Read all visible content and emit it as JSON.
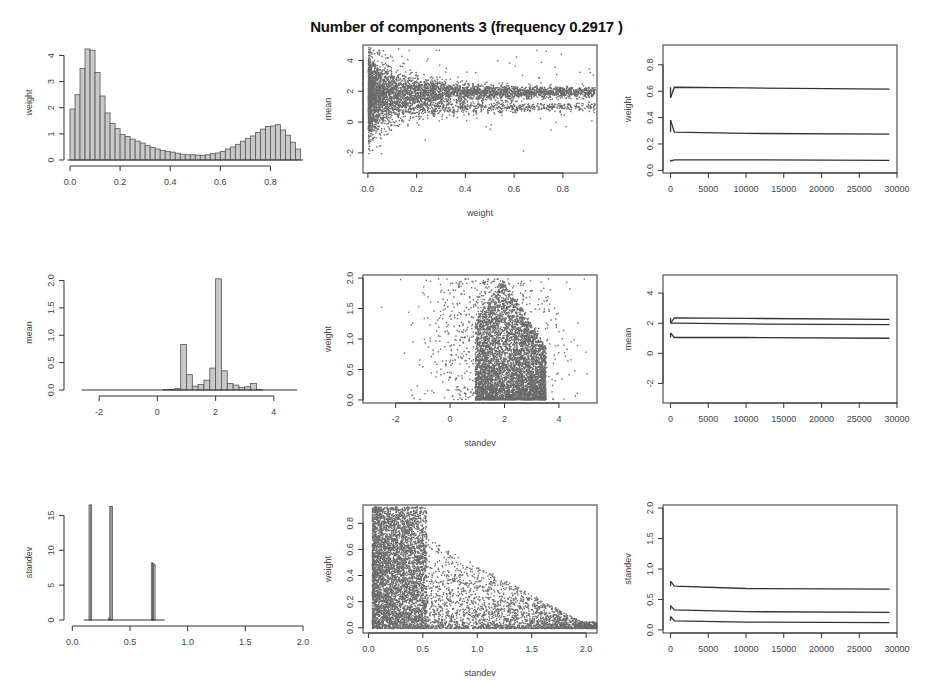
{
  "title": "Number of components 3 (frequency 0.2917 )",
  "colors": {
    "bar_fill": "#c8c8c8",
    "bar_stroke": "#555555",
    "points": "#6b6b6b",
    "lines": "#333333",
    "axes": "#333333"
  },
  "chart_data": [
    {
      "id": "hist-weight",
      "type": "bar",
      "title": "",
      "xlabel": "",
      "ylabel": "weight",
      "xlim": [
        0,
        0.93
      ],
      "ylim": [
        0,
        4.4
      ],
      "xticks": [
        "0.0",
        "0.2",
        "0.4",
        "0.6",
        "0.8"
      ],
      "yticks": [
        "0",
        "1",
        "2",
        "3",
        "4"
      ],
      "bin_width": 0.02,
      "categories": [
        0.01,
        0.03,
        0.05,
        0.07,
        0.09,
        0.11,
        0.13,
        0.15,
        0.17,
        0.19,
        0.21,
        0.23,
        0.25,
        0.27,
        0.29,
        0.31,
        0.33,
        0.35,
        0.37,
        0.39,
        0.41,
        0.43,
        0.45,
        0.47,
        0.49,
        0.51,
        0.53,
        0.55,
        0.57,
        0.59,
        0.61,
        0.63,
        0.65,
        0.67,
        0.69,
        0.71,
        0.73,
        0.75,
        0.77,
        0.79,
        0.81,
        0.83,
        0.85,
        0.87,
        0.89,
        0.91
      ],
      "values": [
        1.95,
        2.5,
        3.5,
        4.25,
        4.2,
        3.35,
        2.45,
        1.8,
        1.4,
        1.2,
        0.98,
        0.9,
        0.8,
        0.72,
        0.65,
        0.55,
        0.48,
        0.42,
        0.36,
        0.33,
        0.3,
        0.26,
        0.22,
        0.2,
        0.2,
        0.19,
        0.18,
        0.2,
        0.24,
        0.27,
        0.33,
        0.42,
        0.5,
        0.6,
        0.72,
        0.83,
        0.92,
        1.05,
        1.18,
        1.28,
        1.3,
        1.35,
        1.15,
        0.95,
        0.68,
        0.42
      ]
    },
    {
      "id": "scatter-weight-mean",
      "type": "scatter",
      "title": "",
      "xlabel": "weight",
      "ylabel": "mean",
      "xlim": [
        -0.02,
        0.94
      ],
      "ylim": [
        -3.3,
        5.0
      ],
      "xticks": [
        "0.0",
        "0.2",
        "0.4",
        "0.6",
        "0.8"
      ],
      "yticks": [
        "-2",
        "0",
        "2",
        "4"
      ],
      "description": "Dense cloud near weight 0 spanning mean -2 to 4, funnelling to bands at mean ~2 and ~1 as weight increases"
    },
    {
      "id": "trace-weight",
      "type": "line",
      "title": "",
      "xlabel": "",
      "ylabel": "weight",
      "xlim": [
        -1000,
        30000
      ],
      "ylim": [
        -0.02,
        0.95
      ],
      "xticks": [
        "0",
        "5000",
        "10000",
        "15000",
        "20000",
        "25000",
        "30000"
      ],
      "yticks": [
        "0.0",
        "0.2",
        "0.4",
        "0.6",
        "0.8"
      ],
      "series": [
        {
          "name": "component 1",
          "x": [
            0,
            500,
            10000,
            29000
          ],
          "values": [
            0.55,
            0.63,
            0.625,
            0.615
          ]
        },
        {
          "name": "component 2",
          "x": [
            0,
            500,
            10000,
            29000
          ],
          "values": [
            0.38,
            0.29,
            0.28,
            0.275
          ]
        },
        {
          "name": "component 3",
          "x": [
            0,
            500,
            10000,
            29000
          ],
          "values": [
            0.07,
            0.08,
            0.08,
            0.075
          ]
        }
      ]
    },
    {
      "id": "hist-mean",
      "type": "bar",
      "title": "",
      "xlabel": "",
      "ylabel": "mean",
      "xlim": [
        -3,
        5
      ],
      "ylim": [
        0,
        2.1
      ],
      "xticks": [
        "-2",
        "0",
        "2",
        "4"
      ],
      "yticks": [
        "0.0",
        "0.5",
        "1.0",
        "1.5",
        "2.0"
      ],
      "bin_width": 0.2,
      "categories": [
        0.3,
        0.5,
        0.7,
        0.9,
        1.1,
        1.3,
        1.5,
        1.7,
        1.9,
        2.1,
        2.3,
        2.5,
        2.7,
        2.9,
        3.1,
        3.3,
        3.5
      ],
      "values": [
        0.01,
        0.01,
        0.03,
        0.83,
        0.28,
        0.07,
        0.1,
        0.18,
        0.4,
        2.03,
        0.35,
        0.12,
        0.09,
        0.05,
        0.06,
        0.12,
        0.01
      ]
    },
    {
      "id": "scatter-standev-weight",
      "type": "scatter",
      "title": "",
      "xlabel": "standev",
      "ylabel": "weight",
      "xlim": [
        -3.2,
        5.4
      ],
      "ylim": [
        -0.05,
        2.05
      ],
      "xticks": [
        "-2",
        "0",
        "2",
        "4"
      ],
      "yticks": [
        "0.0",
        "0.5",
        "1.0",
        "1.5",
        "2.0"
      ],
      "description": "Dense triangular cloud centred around x 1-3.5, concentrated at low y, sparse outliers to x -2.5 and 4.8"
    },
    {
      "id": "trace-mean",
      "type": "line",
      "title": "",
      "xlabel": "",
      "ylabel": "mean",
      "xlim": [
        -1000,
        30000
      ],
      "ylim": [
        -3.3,
        5.2
      ],
      "xticks": [
        "0",
        "5000",
        "10000",
        "15000",
        "20000",
        "25000",
        "30000"
      ],
      "yticks": [
        "-2",
        "0",
        "2",
        "4"
      ],
      "series": [
        {
          "name": "component 1",
          "x": [
            0,
            500,
            10000,
            29000
          ],
          "values": [
            2.0,
            2.35,
            2.32,
            2.25
          ]
        },
        {
          "name": "component 2",
          "x": [
            0,
            500,
            10000,
            29000
          ],
          "values": [
            2.0,
            2.0,
            1.95,
            1.9
          ]
        },
        {
          "name": "component 3",
          "x": [
            0,
            500,
            10000,
            29000
          ],
          "values": [
            1.35,
            1.05,
            1.05,
            1.0
          ]
        }
      ]
    },
    {
      "id": "hist-standev",
      "type": "bar",
      "title": "",
      "xlabel": "",
      "ylabel": "standev",
      "xlim": [
        -0.02,
        2.0
      ],
      "ylim": [
        0,
        16.5
      ],
      "xticks": [
        "0.0",
        "0.5",
        "1.0",
        "1.5",
        "2.0"
      ],
      "yticks": [
        "0",
        "5",
        "10",
        "15"
      ],
      "bin_width": 0.01,
      "categories": [
        0.15,
        0.16,
        0.32,
        0.33,
        0.34,
        0.69,
        0.7,
        0.71
      ],
      "values": [
        16.5,
        16.5,
        0.3,
        16.3,
        16.3,
        8.2,
        8.1,
        7.9
      ]
    },
    {
      "id": "scatter-standev-weight-2",
      "type": "scatter",
      "title": "",
      "xlabel": "standev",
      "ylabel": "weight",
      "xlim": [
        -0.05,
        2.1
      ],
      "ylim": [
        -0.04,
        0.94
      ],
      "xticks": [
        "0.0",
        "0.5",
        "1.0",
        "1.5",
        "2.0"
      ],
      "yticks": [
        "0.0",
        "0.2",
        "0.4",
        "0.6",
        "0.8"
      ],
      "description": "Very dense region at small standev (<0.5) spanning all weights, density decreasing with standev; sparse points toward 2.0"
    },
    {
      "id": "trace-standev",
      "type": "line",
      "title": "",
      "xlabel": "",
      "ylabel": "standev",
      "xlim": [
        -1000,
        30000
      ],
      "ylim": [
        -0.05,
        2.05
      ],
      "xticks": [
        "0",
        "5000",
        "10000",
        "15000",
        "20000",
        "25000",
        "30000"
      ],
      "yticks": [
        "0.0",
        "0.5",
        "1.0",
        "1.5",
        "2.0"
      ],
      "series": [
        {
          "name": "component 1",
          "x": [
            0,
            500,
            10000,
            29000
          ],
          "values": [
            0.8,
            0.72,
            0.68,
            0.67
          ]
        },
        {
          "name": "component 2",
          "x": [
            0,
            500,
            10000,
            29000
          ],
          "values": [
            0.4,
            0.33,
            0.3,
            0.29
          ]
        },
        {
          "name": "component 3",
          "x": [
            0,
            500,
            10000,
            29000
          ],
          "values": [
            0.22,
            0.15,
            0.13,
            0.12
          ]
        }
      ]
    }
  ]
}
